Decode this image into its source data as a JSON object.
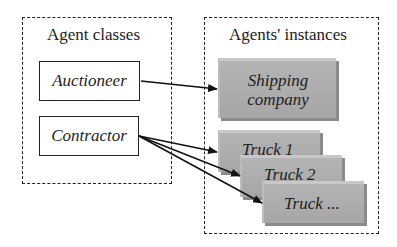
{
  "diagram": {
    "left_group": {
      "title": "Agent classes",
      "classes": [
        "Auctioneer",
        "Contractor"
      ]
    },
    "right_group": {
      "title": "Agents' instances",
      "instances": [
        {
          "label_line1": "Shipping",
          "label_line2": "company"
        },
        {
          "label": "Truck 1"
        },
        {
          "label": "Truck 2"
        },
        {
          "label": "Truck ..."
        }
      ]
    },
    "edges": [
      {
        "from": "Auctioneer",
        "to": "Shipping company"
      },
      {
        "from": "Contractor",
        "to": "Truck 1"
      },
      {
        "from": "Contractor",
        "to": "Truck 2"
      },
      {
        "from": "Contractor",
        "to": "Truck ..."
      }
    ],
    "colors": {
      "instance_fill": "#aaaaaa",
      "stroke": "#222222"
    }
  }
}
